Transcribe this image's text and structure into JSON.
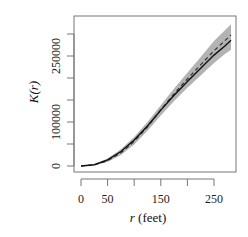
{
  "chart_data": {
    "type": "line",
    "title": "",
    "xlabel": "r (feet)",
    "xlabel_var": "r",
    "xlabel_unit": "(feet)",
    "ylabel": "K(r)",
    "xlim": [
      0,
      285
    ],
    "ylim": [
      0,
      320000
    ],
    "x_ticks": [
      0,
      50,
      100,
      150,
      200,
      250
    ],
    "x_tick_labels": [
      "0",
      "50",
      "",
      "150",
      "",
      "250"
    ],
    "y_ticks": [
      0,
      50000,
      100000,
      150000,
      200000,
      250000,
      300000
    ],
    "y_tick_labels": [
      "0",
      "",
      "100000",
      "",
      "",
      "250000",
      ""
    ],
    "grid": false,
    "legend": null,
    "series": [
      {
        "name": "observed K(r)",
        "style": "solid",
        "color": "#111111",
        "x": [
          0,
          25,
          50,
          75,
          100,
          125,
          150,
          175,
          200,
          225,
          250,
          270,
          282
        ],
        "values": [
          0,
          3000,
          14000,
          33000,
          59000,
          91000,
          127000,
          161000,
          192000,
          222000,
          252000,
          272000,
          286000
        ]
      },
      {
        "name": "theoretical K(r)",
        "style": "dashed",
        "color": "#333333",
        "x": [
          0,
          25,
          50,
          75,
          100,
          125,
          150,
          175,
          200,
          225,
          250,
          270,
          282
        ],
        "values": [
          0,
          2500,
          12000,
          30000,
          56000,
          89000,
          128000,
          164000,
          198000,
          230000,
          262000,
          284000,
          298000
        ]
      },
      {
        "name": "envelope upper",
        "style": "band",
        "color": "#b3b3b3",
        "x": [
          0,
          25,
          50,
          75,
          100,
          125,
          150,
          175,
          200,
          225,
          250,
          270,
          282
        ],
        "values": [
          0,
          4000,
          17000,
          38000,
          66000,
          100000,
          138000,
          176000,
          212000,
          248000,
          284000,
          308000,
          322000
        ]
      },
      {
        "name": "envelope lower",
        "style": "band",
        "color": "#b3b3b3",
        "x": [
          0,
          25,
          50,
          75,
          100,
          125,
          150,
          175,
          200,
          225,
          250,
          270,
          282
        ],
        "values": [
          0,
          1500,
          9000,
          25000,
          49000,
          80000,
          115000,
          148000,
          178000,
          206000,
          234000,
          254000,
          264000
        ]
      }
    ]
  }
}
